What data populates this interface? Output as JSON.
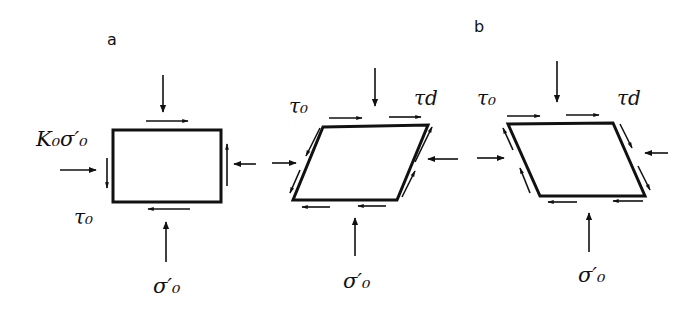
{
  "figure": {
    "panel_labels": {
      "a": "a",
      "b": "b"
    },
    "elements": [
      {
        "id": "element-a",
        "shape": "rectangle",
        "labels": {
          "lateral_stress": "K₀σ′₀",
          "shear_initial": "τ₀",
          "vertical_stress": "σ′₀"
        }
      },
      {
        "id": "element-b-left",
        "shape": "parallelogram-lean-right",
        "labels": {
          "shear_initial": "τ₀",
          "shear_dynamic": "τd",
          "vertical_stress": "σ′₀"
        }
      },
      {
        "id": "element-b-right",
        "shape": "parallelogram-lean-left",
        "labels": {
          "shear_initial": "τ₀",
          "shear_dynamic": "τd",
          "vertical_stress": "σ′₀"
        }
      }
    ]
  },
  "colors": {
    "ink": "#111111",
    "background": "#ffffff"
  }
}
